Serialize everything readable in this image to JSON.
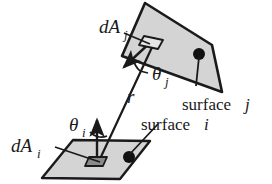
{
  "figure": {
    "name": "radiative-transfer-form-factor-diagram",
    "background_color": "#ffffff",
    "stroke_color": "#1a1a1a",
    "surface_fill_color": "#d4d4d4",
    "patch_fill_color": "#8a8a8a",
    "labels": {
      "dA_j": "dA",
      "dA_j_sub": "j",
      "dA_i": "dA",
      "dA_i_sub": "i",
      "theta_j": "θ",
      "theta_j_sub": "j",
      "theta_i": "θ",
      "theta_i_sub": "i",
      "r": "r",
      "surface_j": "surface",
      "surface_j_sub": "j",
      "surface_i": "surface",
      "surface_i_sub": "i"
    },
    "geometry": {
      "surface_j_polygon": "145,3 212,45 222,92 122,56",
      "surface_i_polygon": "73,140 150,141 120,179 42,178",
      "distance_line": "110,110 152,42",
      "normal_j_line": "152,41 124,67",
      "normal_i_line": "97,161 97,120",
      "leader_surface_j": "203,55 198,88",
      "leader_surface_i": "133,160 160,122",
      "leader_dA_i": "58,146 103,161",
      "leader_dA_j": "122,35 153,45",
      "dot_j": "199,55",
      "dot_i": "133,160",
      "patch_i": "89,158 106,158 102,166 85,166",
      "patch_j_center": "152,41"
    }
  }
}
